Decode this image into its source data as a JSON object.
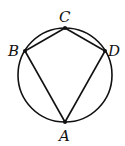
{
  "diagram": {
    "type": "inscribed-quadrilateral",
    "circle": {
      "cx": 65,
      "cy": 75,
      "r": 47
    },
    "points": [
      {
        "name": "A",
        "x": 65,
        "y": 122,
        "label_x": 59,
        "label_y": 141
      },
      {
        "name": "B",
        "x": 25,
        "y": 51,
        "label_x": 8,
        "label_y": 56
      },
      {
        "name": "C",
        "x": 65,
        "y": 28,
        "label_x": 59,
        "label_y": 22
      },
      {
        "name": "D",
        "x": 105,
        "y": 51,
        "label_x": 108,
        "label_y": 56
      }
    ],
    "segments": [
      [
        "A",
        "B"
      ],
      [
        "B",
        "C"
      ],
      [
        "C",
        "D"
      ],
      [
        "D",
        "A"
      ]
    ],
    "colors": {
      "stroke": "#111111",
      "background": "#ffffff"
    }
  }
}
